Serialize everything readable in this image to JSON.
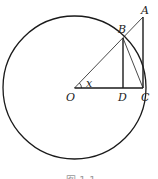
{
  "diagram": {
    "type": "geometry",
    "circle": {
      "center_label": "O",
      "cx": 74.5,
      "cy": 87.5,
      "r": 71.5
    },
    "points": {
      "O": {
        "label": "O",
        "x": 74.5,
        "y": 88
      },
      "A": {
        "label": "A",
        "x": 143,
        "y": 17
      },
      "B": {
        "label": "B",
        "x": 123,
        "y": 38
      },
      "C": {
        "label": "C",
        "x": 143,
        "y": 88
      },
      "D": {
        "label": "D",
        "x": 123,
        "y": 88
      }
    },
    "angle_label": "x",
    "segments": [
      "OA",
      "AC",
      "OC",
      "BD",
      "BC"
    ],
    "caption": "图 1-1",
    "stroke_color": "#1a1a1a"
  }
}
